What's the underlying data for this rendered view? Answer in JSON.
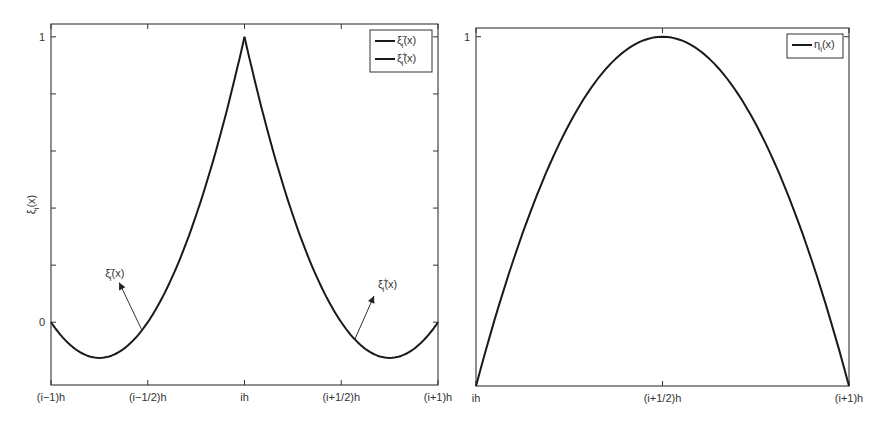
{
  "chart_data": [
    {
      "type": "line",
      "title": "",
      "xlabel": "",
      "ylabel": "ξ_i(x)",
      "xlim": [
        -1,
        1
      ],
      "ylim": [
        -0.22,
        1.045
      ],
      "x_ticks": [
        -1,
        -0.5,
        0,
        0.5,
        1
      ],
      "x_tick_labels": [
        "(i−1)h",
        "(i−1/2)h",
        "ih",
        "(i+1/2)h",
        "(i+1)h"
      ],
      "y_ticks": [
        0,
        0.2,
        0.4,
        0.6,
        0.8,
        1
      ],
      "y_tick_labels": [
        "0",
        "",
        "",
        "",
        "",
        "1"
      ],
      "grid": false,
      "legend_position": "top-right",
      "series": [
        {
          "name": "ξ_i^−(x)",
          "legend_base": "ξ",
          "legend_sub": "i",
          "legend_sup": "−",
          "legend_tail": "(x)",
          "formula": "s(2s−1), s=(x−(i−1)h)/h",
          "x": [
            -1,
            -0.9,
            -0.8,
            -0.75,
            -0.7,
            -0.6,
            -0.5,
            -0.4,
            -0.3,
            -0.2,
            -0.1,
            0
          ],
          "y": [
            0,
            -0.08,
            -0.12,
            -0.125,
            -0.12,
            -0.08,
            0,
            0.12,
            0.28,
            0.48,
            0.72,
            1
          ]
        },
        {
          "name": "ξ_i^+(x)",
          "legend_base": "ξ",
          "legend_sub": "i",
          "legend_sup": "+",
          "legend_tail": "(x)",
          "formula": "(1−s)(1−2s), s=(x−ih)/h",
          "x": [
            0,
            0.1,
            0.2,
            0.3,
            0.4,
            0.5,
            0.6,
            0.7,
            0.75,
            0.8,
            0.9,
            1
          ],
          "y": [
            1,
            0.72,
            0.48,
            0.28,
            0.12,
            0,
            -0.08,
            -0.12,
            -0.125,
            -0.12,
            -0.08,
            0
          ]
        }
      ],
      "annotations": [
        {
          "text_base": "ξ",
          "text_sub": "i",
          "text_sup": "−",
          "text_tail": "(x)",
          "points_to_x": -0.53,
          "text_x": -0.72,
          "text_y": 0.16
        },
        {
          "text_base": "ξ",
          "text_sub": "i",
          "text_sup": "+",
          "text_tail": "(x)",
          "points_to_x": 0.57,
          "text_x": 0.69,
          "text_y": 0.12
        }
      ]
    },
    {
      "type": "line",
      "title": "",
      "xlabel": "",
      "ylabel": "",
      "xlim": [
        0,
        1
      ],
      "ylim": [
        0,
        1.025
      ],
      "x_ticks": [
        0,
        0.5,
        1
      ],
      "x_tick_labels": [
        "ih",
        "(i+1/2)h",
        "(i+1)h"
      ],
      "y_ticks": [
        1
      ],
      "y_tick_labels": [
        "1"
      ],
      "grid": false,
      "legend_position": "top-right",
      "series": [
        {
          "name": "η_i(x)",
          "legend_base": "η",
          "legend_sub": "i",
          "legend_sup": "",
          "legend_tail": "(x)",
          "formula": "4s(1−s), s=(x−ih)/h",
          "x": [
            0,
            0.1,
            0.2,
            0.3,
            0.4,
            0.5,
            0.6,
            0.7,
            0.8,
            0.9,
            1
          ],
          "y": [
            0,
            0.36,
            0.64,
            0.84,
            0.96,
            1,
            0.96,
            0.84,
            0.64,
            0.36,
            0
          ]
        }
      ]
    }
  ]
}
